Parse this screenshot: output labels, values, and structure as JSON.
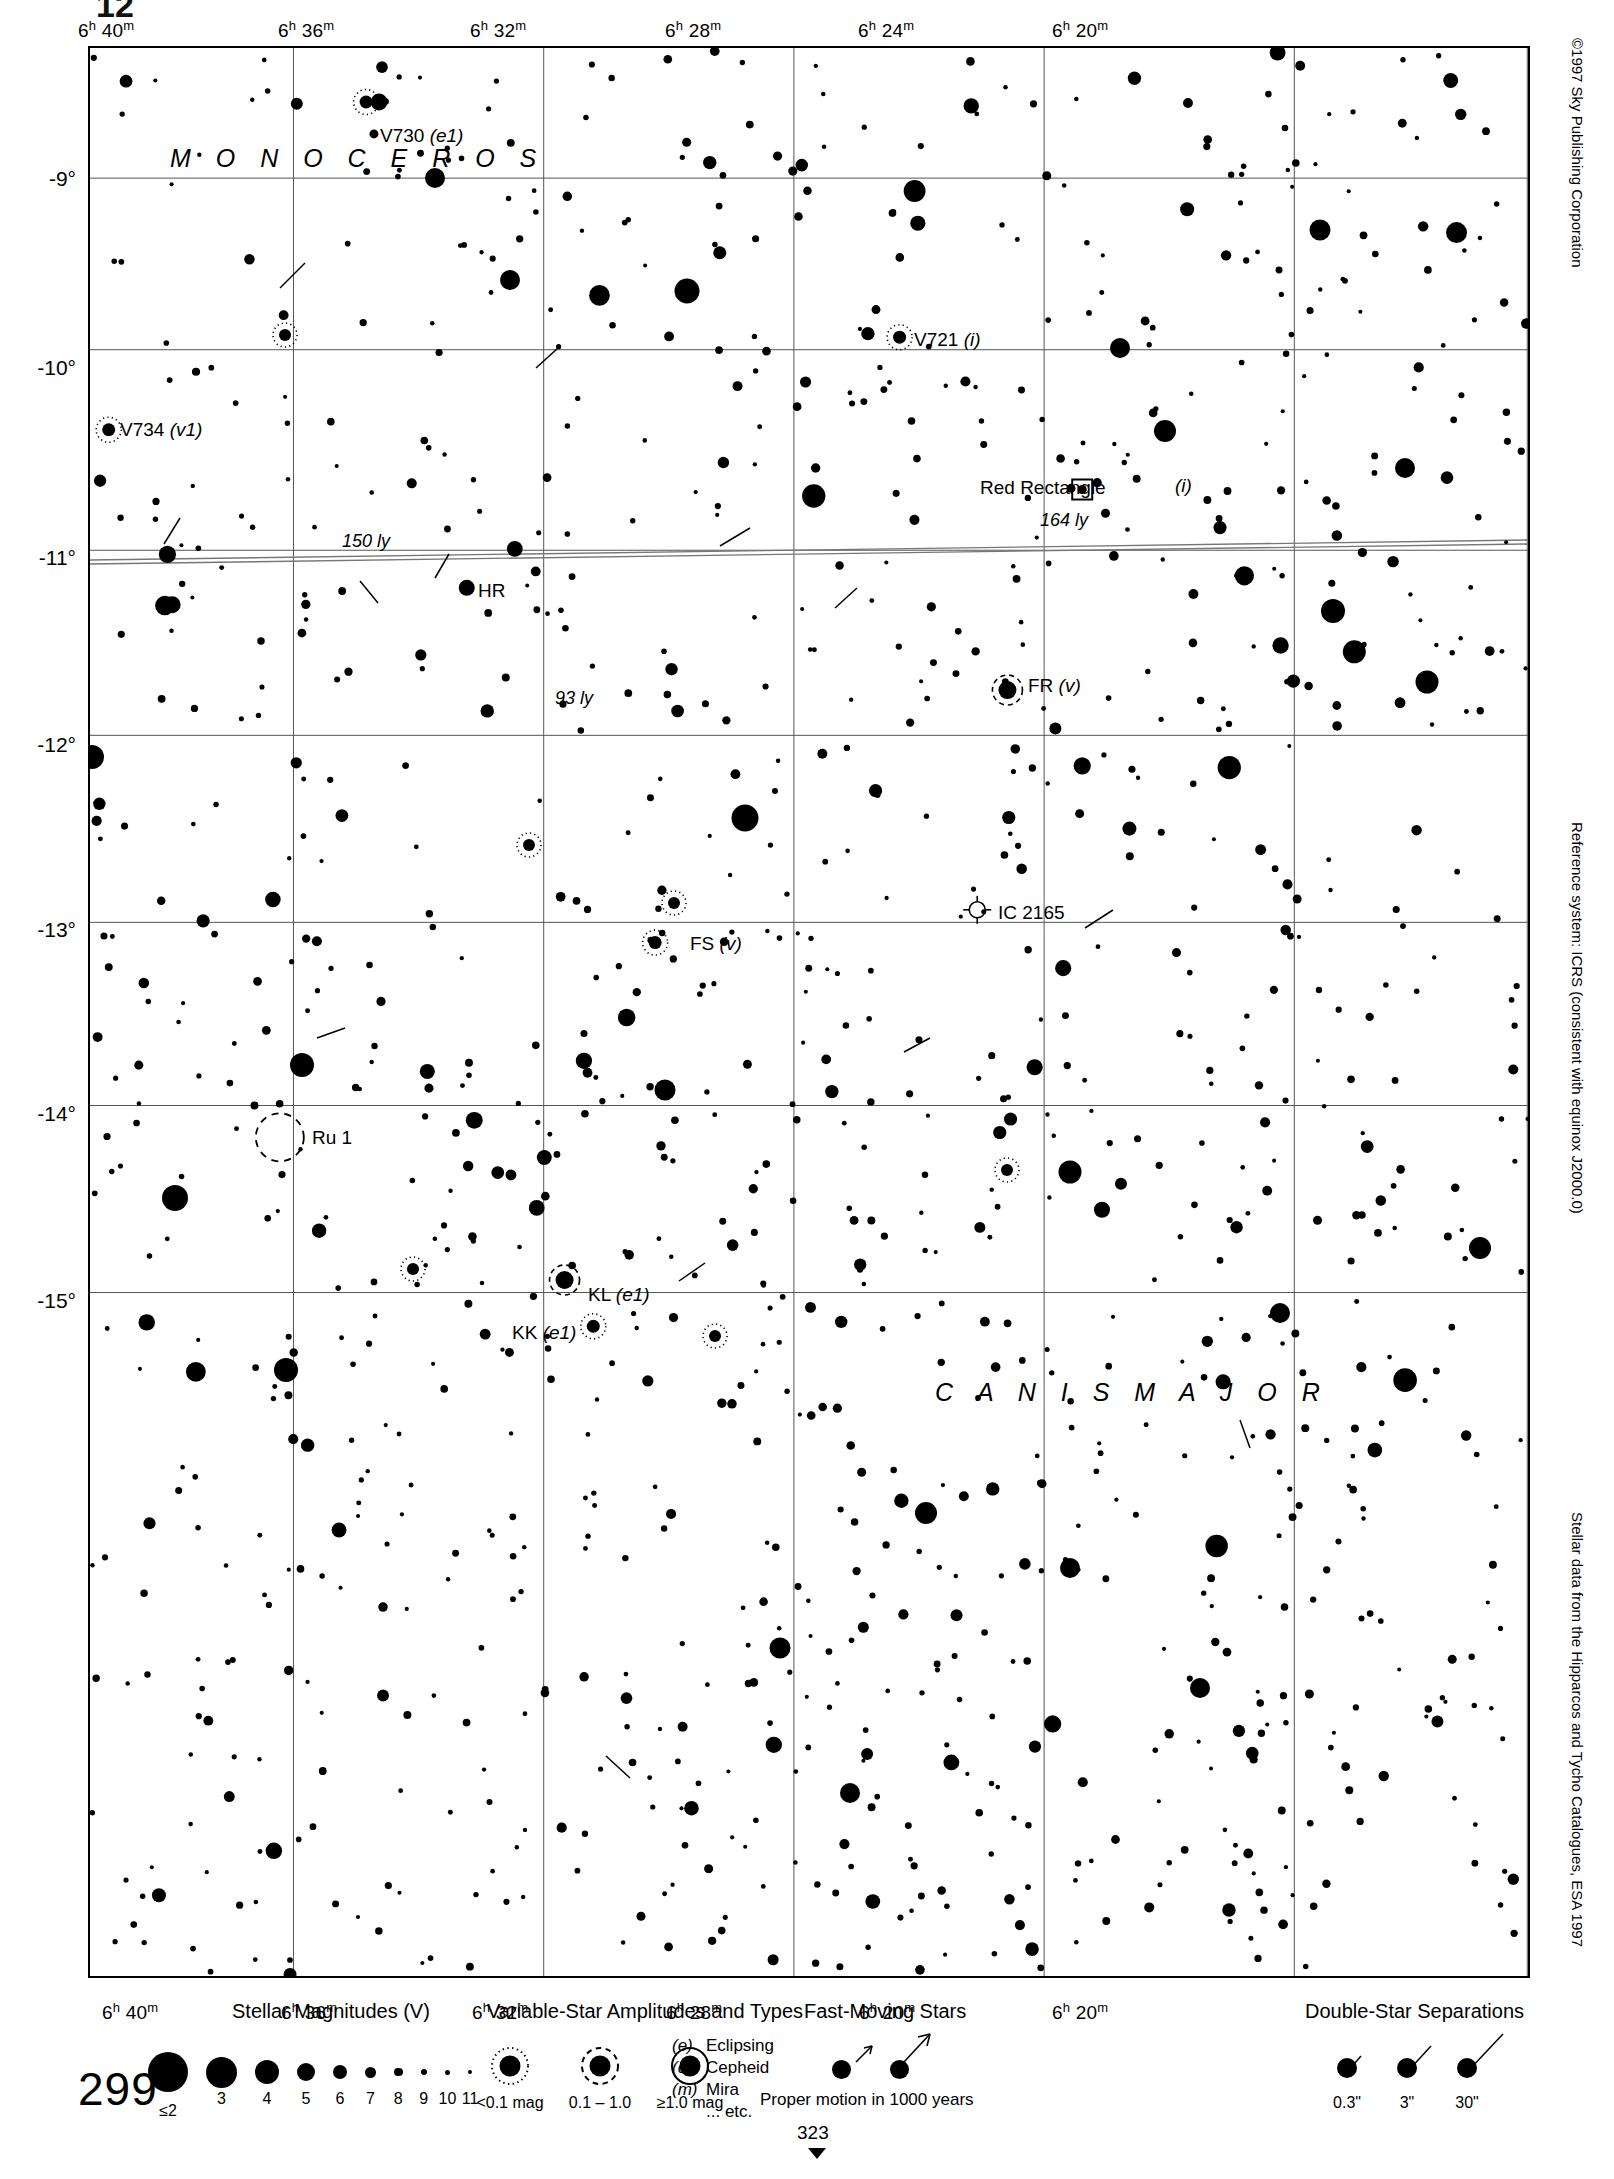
{
  "page": {
    "crop_mark_top": "12",
    "page_number": "299",
    "continuation_number": "323"
  },
  "credits": {
    "copyright": "©1997 Sky Publishing Corporation",
    "reference_system": "Reference system: ICRS (consistent with equinox J2000.0)",
    "data_source": "Stellar data from the Hipparcos and Tycho Catalogues, ESA 1997"
  },
  "chart_data": {
    "type": "scatter",
    "xlabel": "Right Ascension",
    "ylabel": "Declination",
    "grid": true,
    "xlim": [
      "6h 42m",
      "6h 19m"
    ],
    "ylim": [
      -15.6,
      -8.5
    ],
    "ra_ticks": [
      {
        "label": "6h 40m",
        "h": "6",
        "m": "40",
        "x": 0.1415
      },
      {
        "label": "6h 36m",
        "h": "6",
        "m": "36",
        "x": 0.3155
      },
      {
        "label": "6h 32m",
        "h": "6",
        "m": "32",
        "x": 0.4895
      },
      {
        "label": "6h 28m",
        "h": "6",
        "m": "28",
        "x": 0.6635
      },
      {
        "label": "6h 24m",
        "h": "6",
        "m": "24",
        "x": 0.8375
      },
      {
        "label": "6h 20m",
        "h": "6",
        "m": "20",
        "x": 0.9995
      }
    ],
    "dec_ticks": [
      {
        "label": "-9°",
        "y": 0.0675
      },
      {
        "label": "-10°",
        "y": 0.1565
      },
      {
        "label": "-11°",
        "y": 0.2605
      },
      {
        "label": "-12°",
        "y": 0.3565
      },
      {
        "label": "-13°",
        "y": 0.4535
      },
      {
        "label": "-14°",
        "y": 0.5485
      },
      {
        "label": "-15°",
        "y": 0.6455
      }
    ],
    "constellations": [
      {
        "name": "M O N O C E R O S",
        "x": 0.055,
        "y": 0.055
      },
      {
        "name": "C A N I S  M A J O R",
        "x": 0.585,
        "y": 0.695
      }
    ],
    "labeled_objects": [
      {
        "name": "V730",
        "type": "(e1)",
        "kind": "variable-amp-small",
        "x": 0.192,
        "y": 0.028,
        "label_dx": 12,
        "label_dy": -10
      },
      {
        "name": "V721",
        "type": "(i)",
        "kind": "variable-amp-small",
        "x": 0.563,
        "y": 0.15,
        "label_dx": 12,
        "label_dy": -10
      },
      {
        "name": "V734",
        "type": "(v1)",
        "kind": "variable-amp-small",
        "x": 0.013,
        "y": 0.198,
        "label_dx": 12,
        "label_dy": -10
      },
      {
        "name": "Red Rectangle",
        "type": "(i)",
        "kind": "nebula-square",
        "x": 0.69,
        "y": 0.229,
        "label_dx": -118,
        "label_dy": -10
      },
      {
        "name": "HR",
        "type": "",
        "kind": "star",
        "x": 0.262,
        "y": 0.28,
        "label_dx": 12,
        "label_dy": -9
      },
      {
        "name": "FR",
        "type": "(v)",
        "kind": "variable-amp-mid",
        "x": 0.638,
        "y": 0.333,
        "label_dx": 13,
        "label_dy": -11
      },
      {
        "name": "IC 2165",
        "type": "",
        "kind": "planetary-nebula",
        "x": 0.617,
        "y": 0.447,
        "label_dx": 14,
        "label_dy": -9
      },
      {
        "name": "FS",
        "type": "(v)",
        "kind": "variable-amp-small",
        "x": 0.393,
        "y": 0.464,
        "label_dx": 13,
        "label_dy": -9
      },
      {
        "name": "Ru 1",
        "type": "",
        "kind": "open-cluster",
        "x": 0.132,
        "y": 0.565,
        "label_dx": 26,
        "label_dy": -10
      },
      {
        "name": "KL",
        "type": "(e1)",
        "kind": "variable-amp-mid",
        "x": 0.33,
        "y": 0.639,
        "label_dx": 14,
        "label_dy": -9
      },
      {
        "name": "KK",
        "type": "(e1)",
        "kind": "variable-amp-small",
        "x": 0.35,
        "y": 0.663,
        "label_dx": -66,
        "label_dy": -9
      }
    ],
    "distance_annotations": [
      {
        "label": "150 ly",
        "x": 0.175,
        "y": 0.253
      },
      {
        "label": "164 ly",
        "x": 0.66,
        "y": 0.244
      },
      {
        "label": "93 ly",
        "x": 0.323,
        "y": 0.334
      }
    ]
  },
  "legend": {
    "magnitudes": {
      "title": "Stellar Magnitudes (V)",
      "items": [
        {
          "label": "≤2",
          "size": 40
        },
        {
          "label": "3",
          "size": 31
        },
        {
          "label": "4",
          "size": 24
        },
        {
          "label": "5",
          "size": 18
        },
        {
          "label": "6",
          "size": 14
        },
        {
          "label": "7",
          "size": 11
        },
        {
          "label": "8",
          "size": 8.5
        },
        {
          "label": "9",
          "size": 6.5
        },
        {
          "label": "10",
          "size": 5
        },
        {
          "label": "11",
          "size": 4
        }
      ]
    },
    "variables": {
      "title": "Variable-Star Amplitudes and Types",
      "amplitudes": [
        {
          "label": "<0.1 mag",
          "style": "dotted"
        },
        {
          "label": "0.1 – 1.0",
          "style": "dashed"
        },
        {
          "label": "≥1.0 mag",
          "style": "solid"
        }
      ],
      "types": [
        {
          "code": "(e)",
          "name": "Eclipsing"
        },
        {
          "code": "(c)",
          "name": "Cepheid"
        },
        {
          "code": "(m)",
          "name": "Mira"
        },
        {
          "code": "",
          "name": "... etc."
        }
      ]
    },
    "fast_moving": {
      "title": "Fast-Moving Stars",
      "caption": "Proper motion in 1000 years"
    },
    "doubles": {
      "title": "Double-Star Separations",
      "items": [
        {
          "label": "0.3\""
        },
        {
          "label": "3\""
        },
        {
          "label": "30\""
        }
      ]
    }
  }
}
